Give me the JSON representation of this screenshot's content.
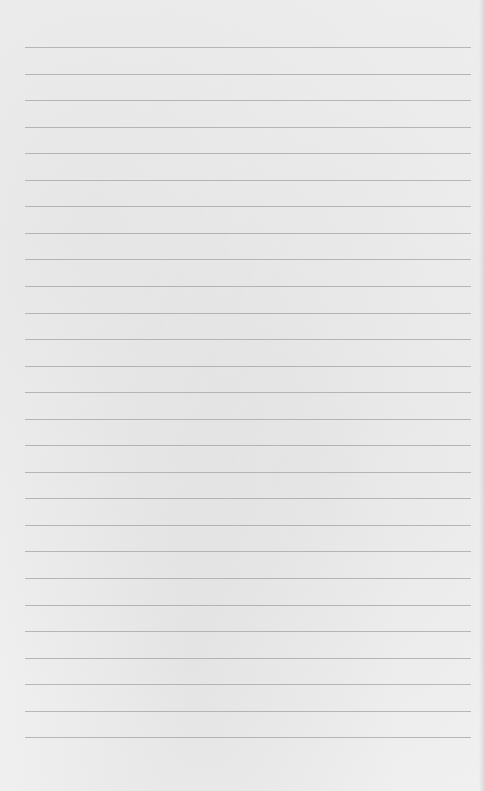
{
  "page": {
    "type": "lined-paper",
    "background_color": "#f0f0f0",
    "rule_color": "#a8a8a8",
    "rule_count": 27,
    "first_rule_y": 47,
    "rule_spacing": 26.55,
    "rule_left": 25,
    "rule_width": 446,
    "text_lines": []
  }
}
